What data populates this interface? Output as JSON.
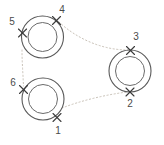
{
  "diagram": {
    "title": "",
    "background_color": "#ffffff",
    "colors": {
      "ring_outer_stroke": "#595959",
      "ring_inner_stroke": "#6b6b6b",
      "connector_stroke": "#c9c2b8",
      "marker_stroke": "#3a3a3a",
      "label_fill": "#4a4a4a"
    },
    "rings": [
      {
        "id": "ring-top-left",
        "name": "top-left-annulus",
        "cx": 42.5,
        "cy": 37.0,
        "outer_r": 21.0,
        "inner_r": 14.5
      },
      {
        "id": "ring-bottom-left",
        "name": "bottom-left-annulus",
        "cx": 43.0,
        "cy": 99.0,
        "outer_r": 21.0,
        "inner_r": 14.5
      },
      {
        "id": "ring-right",
        "name": "right-annulus",
        "cx": 130.0,
        "cy": 71.0,
        "outer_r": 21.0,
        "inner_r": 14.5
      }
    ],
    "markers": [
      {
        "id": "marker-1",
        "label": "1",
        "x": 57.0,
        "y": 117.5,
        "label_x": 58.0,
        "label_y": 134.0,
        "ring": "ring-bottom-left"
      },
      {
        "id": "marker-2",
        "label": "2",
        "x": 130.0,
        "y": 92.0,
        "label_x": 130.0,
        "label_y": 107.0,
        "ring": "ring-right"
      },
      {
        "id": "marker-3",
        "label": "3",
        "x": 130.5,
        "y": 50.5,
        "label_x": 136.0,
        "label_y": 40.0,
        "ring": "ring-right"
      },
      {
        "id": "marker-4",
        "label": "4",
        "x": 56.5,
        "y": 20.5,
        "label_x": 62.0,
        "label_y": 13.0,
        "ring": "ring-top-left"
      },
      {
        "id": "marker-5",
        "label": "5",
        "x": 22.5,
        "y": 33.0,
        "label_x": 12.0,
        "label_y": 25.0,
        "ring": "ring-top-left"
      },
      {
        "id": "marker-6",
        "label": "6",
        "x": 23.5,
        "y": 89.5,
        "label_x": 13.0,
        "label_y": 86.0,
        "ring": "ring-bottom-left"
      }
    ],
    "connectors": [
      {
        "id": "connector-4-3",
        "name": "connector-marker4-to-marker3",
        "from": "4",
        "to": "3",
        "path": "M 59 22 C 75 37, 100 50, 128 50"
      },
      {
        "id": "connector-1-2",
        "name": "connector-marker1-to-marker2",
        "from": "1",
        "to": "2",
        "path": "M 62 108 C 80 101, 104 95, 127 92"
      },
      {
        "id": "connector-5-6",
        "name": "connector-marker5-to-marker6",
        "from": "5",
        "to": "6",
        "path": "M 22 50 C 22 62, 23 74, 23.5 86"
      }
    ],
    "marker_arm": 4.0
  }
}
